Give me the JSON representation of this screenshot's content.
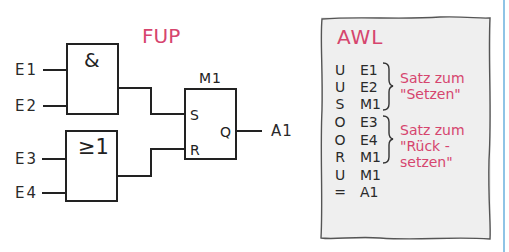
{
  "colors": {
    "accent": "#d6456e",
    "line": "#222222",
    "panel_bg": "#efefef",
    "rule": "#8ec4e6"
  },
  "fup": {
    "title": "FUP",
    "and_gate": {
      "symbol": "&",
      "inputs": [
        "E1",
        "E2"
      ]
    },
    "or_gate": {
      "symbol": "≥1",
      "inputs": [
        "E3",
        "E4"
      ]
    },
    "flipflop": {
      "name": "M1",
      "set_pin": "S",
      "reset_pin": "R",
      "output_pin": "Q"
    },
    "output": "A1"
  },
  "awl": {
    "title": "AWL",
    "rows": [
      {
        "op": "U",
        "arg": "E1"
      },
      {
        "op": "U",
        "arg": "E2"
      },
      {
        "op": "S",
        "arg": "M1"
      },
      {
        "op": "O",
        "arg": "E3"
      },
      {
        "op": "O",
        "arg": "E4"
      },
      {
        "op": "R",
        "arg": "M1"
      },
      {
        "op": "U",
        "arg": "M1"
      },
      {
        "op": "=",
        "arg": "A1"
      }
    ],
    "notes": [
      {
        "line1": "Satz zum",
        "line2": "\"Setzen\""
      },
      {
        "line1": "Satz zum",
        "line2": "\"Rück -",
        "line3": "setzen\""
      }
    ]
  }
}
